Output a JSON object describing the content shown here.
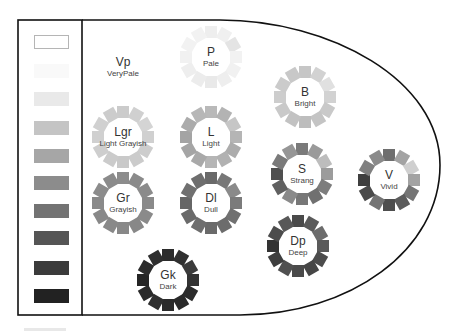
{
  "diagram": {
    "frame": {
      "left": 18,
      "top": 20,
      "right": 440,
      "bottom": 315,
      "divider_x": 82,
      "stroke_color": "#111111"
    },
    "gray_scale": [
      {
        "name": "white",
        "color": "#ffffff",
        "outlined": true,
        "y": 35
      },
      {
        "name": "near-white",
        "color": "#f9f9f9",
        "y": 64
      },
      {
        "name": "very-light-gray",
        "color": "#e9e9e9",
        "y": 92
      },
      {
        "name": "light-gray",
        "color": "#c4c4c4",
        "y": 121
      },
      {
        "name": "gray-1",
        "color": "#a6a6a6",
        "y": 149
      },
      {
        "name": "gray-2",
        "color": "#8c8c8c",
        "y": 176
      },
      {
        "name": "gray-3",
        "color": "#737373",
        "y": 204
      },
      {
        "name": "dark-gray-1",
        "color": "#555555",
        "y": 231
      },
      {
        "name": "dark-gray-2",
        "color": "#3b3b3b",
        "y": 261
      },
      {
        "name": "near-black",
        "color": "#222222",
        "y": 289
      }
    ],
    "tones": [
      {
        "id": "vp",
        "abbr": "Vp",
        "name": "VeryPale",
        "cx": 123,
        "cy": 67,
        "ring": false,
        "colors": []
      },
      {
        "id": "p",
        "abbr": "P",
        "name": "Pale",
        "cx": 211,
        "cy": 57,
        "ring": true,
        "colors": [
          "#eeeeee",
          "#f0f0f0",
          "#e4e4e4",
          "#f2f2f2",
          "#f1f1f1",
          "#eeeeee",
          "#e9e9e9",
          "#ececec",
          "#eeeeee",
          "#f1f1f1",
          "#f2f2f2",
          "#f2f2f2"
        ]
      },
      {
        "id": "b",
        "abbr": "B",
        "name": "Bright",
        "cx": 305,
        "cy": 97,
        "ring": true,
        "colors": [
          "#c6c6c6",
          "#d2d2d2",
          "#e0e0e0",
          "#d2d2d2",
          "#c9c9c9",
          "#c4c4c4",
          "#bdbdbd",
          "#c2c2c2",
          "#c9c9c9",
          "#cdcdcd",
          "#cbcbcb",
          "#c8c8c8"
        ]
      },
      {
        "id": "lgr",
        "abbr": "Lgr",
        "name": "Light Grayish",
        "cx": 123,
        "cy": 137,
        "ring": true,
        "colors": [
          "#cbcbcb",
          "#d0d0d0",
          "#d4d4d4",
          "#d0d0d0",
          "#cdcdcd",
          "#cbcbcb",
          "#c9c9c9",
          "#cbcbcb",
          "#cecece",
          "#d0d0d0",
          "#d0d0d0",
          "#cccccc"
        ]
      },
      {
        "id": "l",
        "abbr": "L",
        "name": "Light",
        "cx": 211,
        "cy": 137,
        "ring": true,
        "colors": [
          "#b9b9b9",
          "#b3b3b3",
          "#c6c6c6",
          "#b5b5b5",
          "#acacac",
          "#b1b1b1",
          "#b5b5b5",
          "#a9a9a9",
          "#a5a5a5",
          "#a4a4a4",
          "#ababab",
          "#b7b7b7"
        ]
      },
      {
        "id": "s",
        "abbr": "S",
        "name": "Strang",
        "cx": 302,
        "cy": 174,
        "ring": true,
        "colors": [
          "#7a7a7a",
          "#9a9a9a",
          "#bdbdbd",
          "#9c9c9c",
          "#7d7d7d",
          "#707070",
          "#777777",
          "#8a8a8a",
          "#606060",
          "#4f4f4f",
          "#7a7a7a",
          "#969696"
        ]
      },
      {
        "id": "v",
        "abbr": "V",
        "name": "Vivid",
        "cx": 389,
        "cy": 180,
        "ring": true,
        "colors": [
          "#6f6f6f",
          "#a3a3a3",
          "#cfcfcf",
          "#a3a3a3",
          "#757575",
          "#5c5c5c",
          "#4e4e4e",
          "#747474",
          "#4a4a4a",
          "#3f3f3f",
          "#808080",
          "#8a8a8a"
        ]
      },
      {
        "id": "gr",
        "abbr": "Gr",
        "name": "Grayish",
        "cx": 123,
        "cy": 203,
        "ring": true,
        "colors": [
          "#8c8c8c",
          "#8a8a8a",
          "#8b8b8b",
          "#8a8a8a",
          "#8a8a8a",
          "#888888",
          "#888888",
          "#898989",
          "#888888",
          "#8a8a8a",
          "#8c8c8c",
          "#8b8b8b"
        ]
      },
      {
        "id": "dl",
        "abbr": "Dl",
        "name": "Dull",
        "cx": 211,
        "cy": 203,
        "ring": true,
        "colors": [
          "#696969",
          "#777777",
          "#8a8a8a",
          "#7b7b7b",
          "#707070",
          "#6c6c6c",
          "#6a6a6a",
          "#6e6e6e",
          "#6a6a6a",
          "#666666",
          "#707070",
          "#6e6e6e"
        ]
      },
      {
        "id": "dp",
        "abbr": "Dp",
        "name": "Deep",
        "cx": 298,
        "cy": 246,
        "ring": true,
        "colors": [
          "#4a4a4a",
          "#5a5a5a",
          "#6c6c6c",
          "#5a5a5a",
          "#4c4c4c",
          "#464646",
          "#4a4a4a",
          "#505050",
          "#3e3e3e",
          "#333333",
          "#4c4c4c",
          "#585858"
        ]
      },
      {
        "id": "gk",
        "abbr": "Gk",
        "name": "Dark",
        "cx": 168,
        "cy": 280,
        "ring": true,
        "colors": [
          "#2c2c2c",
          "#303030",
          "#3b3b3b",
          "#333333",
          "#2c2c2c",
          "#2a2a2a",
          "#2b2b2b",
          "#2f2f2f",
          "#2a2a2a",
          "#252525",
          "#2c2c2c",
          "#2e2e2e"
        ]
      }
    ]
  }
}
